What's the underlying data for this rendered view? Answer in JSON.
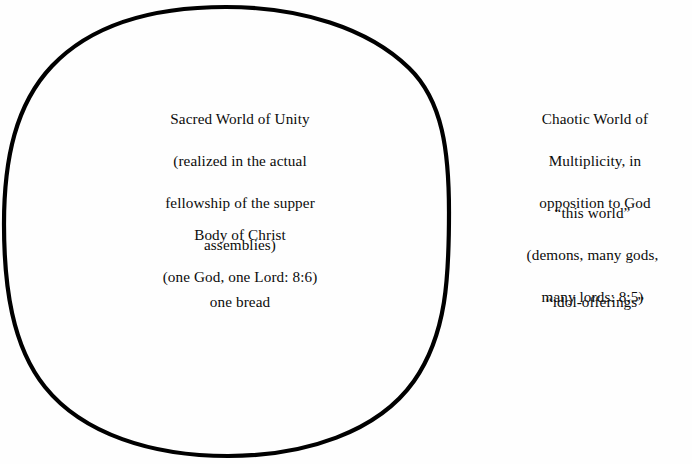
{
  "figure": {
    "background_color": "#fefefe",
    "ink_color": "#000000"
  },
  "circle": {
    "label": "large hand-drawn circle enclosing the sacred-world text",
    "stroke_color": "#000000",
    "stroke_width_px": 4,
    "center_x": 226,
    "center_y": 231,
    "radius_x": 222,
    "radius_y": 224
  },
  "inside_circle": {
    "sacred_unity": {
      "lines": [
        "Sacred World of Unity",
        "(realized in the actual",
        "fellowship of the supper",
        "assemblies)"
      ]
    },
    "body_of_christ": {
      "lines": [
        "Body of Christ",
        "(one God, one Lord: 8:6)"
      ]
    },
    "one_bread": {
      "lines": [
        "one bread"
      ]
    }
  },
  "outside_circle": {
    "chaotic_multiplicity": {
      "lines": [
        "Chaotic World of",
        "Multiplicity, in",
        "opposition to God"
      ]
    },
    "this_world": {
      "lines": [
        "“this world”",
        "(demons, many gods,",
        "many lords: 8:5)"
      ]
    },
    "idol_offerings": {
      "lines": [
        "“idol-offerings”"
      ]
    }
  }
}
